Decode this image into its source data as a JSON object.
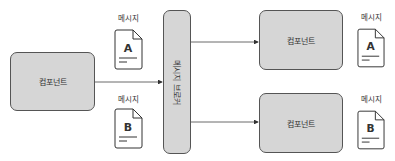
{
  "components": {
    "left": {
      "label": "컴포넌트"
    },
    "right_top": {
      "label": "컴포넌트"
    },
    "right_bottom": {
      "label": "컴포넌트"
    }
  },
  "broker": {
    "label": "메시지 브로커"
  },
  "messages": [
    {
      "caption": "메시지",
      "letter": "A"
    },
    {
      "caption": "메시지",
      "letter": "B"
    },
    {
      "caption": "메시지",
      "letter": "A"
    },
    {
      "caption": "메시지",
      "letter": "B"
    }
  ],
  "colors": {
    "box_fill": "#d6d6d6",
    "stroke": "#555555"
  }
}
